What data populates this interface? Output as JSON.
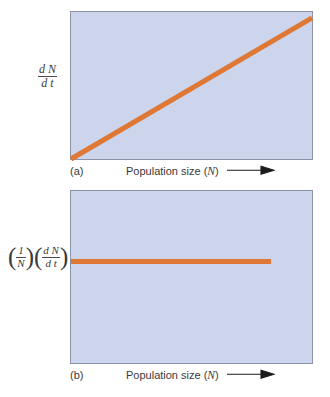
{
  "figure": {
    "background_color": "#ffffff",
    "plot_background_color": "#ccd5ec",
    "plot_border_color": "#8b93a8",
    "curve_color": "#df7835"
  },
  "panels": [
    {
      "letter": "(a)",
      "ylabel": {
        "numerator": "d N",
        "denominator": "d t"
      },
      "xlabel_text": "Population size (",
      "xlabel_var": "N",
      "xlabel_close": ")",
      "arrow_icon": "right-arrow-icon"
    },
    {
      "letter": "(b)",
      "ylabel_first": {
        "numerator": "1",
        "denominator": "N"
      },
      "ylabel_second": {
        "numerator": "d N",
        "denominator": "d t"
      },
      "xlabel_text": "Population size (",
      "xlabel_var": "N",
      "xlabel_close": ")",
      "arrow_icon": "right-arrow-icon"
    }
  ],
  "chart_data": [
    {
      "type": "line",
      "title": "",
      "xlabel": "Population size (N)",
      "ylabel": "dN/dt",
      "panel": "(a)",
      "grid": false,
      "legend": "none",
      "xlim": [
        0,
        100
      ],
      "ylim": [
        0,
        100
      ],
      "series": [
        {
          "name": "Exponential population growth rate",
          "color": "#df7835",
          "x": [
            0,
            100
          ],
          "values": [
            0,
            96
          ],
          "line_width": 5,
          "description": "Straight line rising from the lower-left corner to the upper-right"
        }
      ]
    },
    {
      "type": "line",
      "title": "",
      "xlabel": "Population size (N)",
      "ylabel": "(1/N)(dN/dt)",
      "panel": "(b)",
      "grid": false,
      "legend": "none",
      "xlim": [
        0,
        100
      ],
      "ylim": [
        0,
        100
      ],
      "series": [
        {
          "name": "Per capita growth rate",
          "color": "#df7835",
          "x": [
            0,
            83
          ],
          "values": [
            59,
            59
          ],
          "line_width": 5,
          "description": "Horizontal constant line from the left edge ending before the right edge"
        }
      ]
    }
  ]
}
